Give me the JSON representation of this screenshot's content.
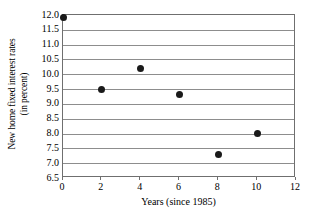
{
  "chart_data": {
    "type": "scatter",
    "title": "",
    "xlabel": "Years (since 1985)",
    "ylabel": "New home fixed interest rates (in percent)",
    "ylabel_lines": [
      "New home fixed interest rates",
      "(in percent)"
    ],
    "x": [
      0,
      2,
      4,
      6,
      8,
      10
    ],
    "values": [
      11.9,
      9.5,
      10.2,
      9.33,
      7.3,
      8.0
    ],
    "points": [
      {
        "x": 0,
        "y": 11.9
      },
      {
        "x": 2,
        "y": 9.5
      },
      {
        "x": 4,
        "y": 10.2
      },
      {
        "x": 6,
        "y": 9.33
      },
      {
        "x": 8,
        "y": 7.3
      },
      {
        "x": 10,
        "y": 8.0
      }
    ],
    "xlim": [
      0,
      12
    ],
    "ylim": [
      6.5,
      12.0
    ],
    "xticks": [
      0,
      2,
      4,
      6,
      8,
      10,
      12
    ],
    "xtick_labels": [
      "0",
      "2",
      "4",
      "6",
      "8",
      "10",
      "12"
    ],
    "yticks": [
      6.5,
      7.0,
      7.5,
      8.0,
      8.5,
      9.0,
      9.5,
      10.0,
      10.5,
      11.0,
      11.5,
      12.0
    ],
    "ytick_labels": [
      "6.5",
      "7.0",
      "7.5",
      "8.0",
      "8.5",
      "9.0",
      "9.5",
      "10.0",
      "10.5",
      "11.0",
      "11.5",
      "12.0"
    ],
    "grid": "horizontal",
    "legend": null,
    "marker_color": "#1a1a1a",
    "grid_color": "#8d8d8d",
    "axis_color": "#6f6f6f",
    "background_color": "#ffffff"
  }
}
